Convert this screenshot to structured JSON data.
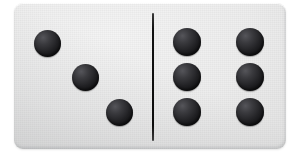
{
  "scene": {
    "subject": "domino-tile",
    "background_color": "#ffffff",
    "tile": {
      "face_color": "#ededed",
      "edge_shadow_color": "#d8d9da",
      "corner_radius_px": 9,
      "x": 14,
      "y": 3,
      "width": 272,
      "height": 146
    },
    "divider": {
      "name": "center-divider-line",
      "color": "#0c0c0c",
      "x": 152,
      "y": 13,
      "width": 2,
      "height": 128
    },
    "pip_style": {
      "color": "#1a1a1c",
      "highlight_color": "#55555a",
      "diameter_px": 27
    },
    "halves": [
      {
        "name": "left-half",
        "pip_count": 3,
        "arrangement": "diagonal",
        "pips": [
          {
            "name": "pip-left-1",
            "cx": 47,
            "cy": 43,
            "r": 13.5
          },
          {
            "name": "pip-left-2",
            "cx": 85,
            "cy": 77,
            "r": 13.5
          },
          {
            "name": "pip-left-3",
            "cx": 119,
            "cy": 112,
            "r": 13.5
          }
        ]
      },
      {
        "name": "right-half",
        "pip_count": 6,
        "arrangement": "two-columns-three-rows",
        "pips": [
          {
            "name": "pip-right-1",
            "cx": 187,
            "cy": 42,
            "r": 14
          },
          {
            "name": "pip-right-2",
            "cx": 250,
            "cy": 42,
            "r": 14
          },
          {
            "name": "pip-right-3",
            "cx": 187,
            "cy": 77,
            "r": 14
          },
          {
            "name": "pip-right-4",
            "cx": 250,
            "cy": 77,
            "r": 14
          },
          {
            "name": "pip-right-5",
            "cx": 187,
            "cy": 112,
            "r": 14
          },
          {
            "name": "pip-right-6",
            "cx": 250,
            "cy": 112,
            "r": 14
          }
        ]
      }
    ]
  }
}
